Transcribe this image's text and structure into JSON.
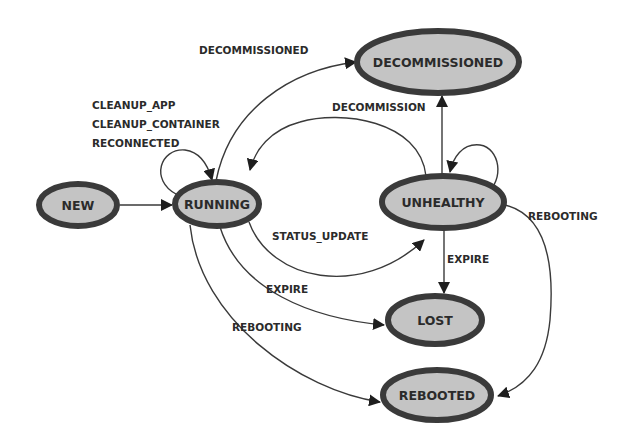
{
  "diagram": {
    "type": "state-machine",
    "colors": {
      "node_fill": "#c4c4c4",
      "node_stroke": "#3a3a3a",
      "edge": "#3a3a3a",
      "text": "#2b2b2b",
      "background": "#ffffff"
    },
    "states": [
      {
        "id": "new",
        "label": "NEW"
      },
      {
        "id": "running",
        "label": "RUNNING"
      },
      {
        "id": "decommissioned",
        "label": "DECOMMISSIONED"
      },
      {
        "id": "unhealthy",
        "label": "UNHEALTHY"
      },
      {
        "id": "lost",
        "label": "LOST"
      },
      {
        "id": "rebooted",
        "label": "REBOOTED"
      }
    ],
    "transitions": [
      {
        "from": "NEW",
        "to": "RUNNING",
        "label": ""
      },
      {
        "from": "RUNNING",
        "to": "RUNNING",
        "label_lines": [
          "CLEANUP_APP",
          "CLEANUP_CONTAINER",
          "RECONNECTED"
        ]
      },
      {
        "from": "RUNNING",
        "to": "DECOMMISSIONED",
        "label": "DECOMMISSIONED"
      },
      {
        "from": "UNHEALTHY",
        "to": "RUNNING",
        "label": ""
      },
      {
        "from": "UNHEALTHY",
        "to": "DECOMMISSIONED",
        "label": "DECOMMISSION"
      },
      {
        "from": "UNHEALTHY",
        "to": "UNHEALTHY",
        "label": ""
      },
      {
        "from": "RUNNING",
        "to": "UNHEALTHY",
        "label": "STATUS_UPDATE"
      },
      {
        "from": "RUNNING",
        "to": "LOST",
        "label": "EXPIRE"
      },
      {
        "from": "UNHEALTHY",
        "to": "LOST",
        "label": "EXPIRE"
      },
      {
        "from": "RUNNING",
        "to": "REBOOTED",
        "label": "REBOOTING"
      },
      {
        "from": "UNHEALTHY",
        "to": "REBOOTED",
        "label": "REBOOTING"
      }
    ],
    "edge_labels": {
      "running_self_1": "CLEANUP_APP",
      "running_self_2": "CLEANUP_CONTAINER",
      "running_self_3": "RECONNECTED",
      "running_to_decommissioned": "DECOMMISSIONED",
      "unhealthy_to_decommissioned": "DECOMMISSION",
      "running_to_unhealthy": "STATUS_UPDATE",
      "running_to_lost": "EXPIRE",
      "unhealthy_to_lost": "EXPIRE",
      "running_to_rebooted": "REBOOTING",
      "unhealthy_to_rebooted": "REBOOTING"
    }
  }
}
